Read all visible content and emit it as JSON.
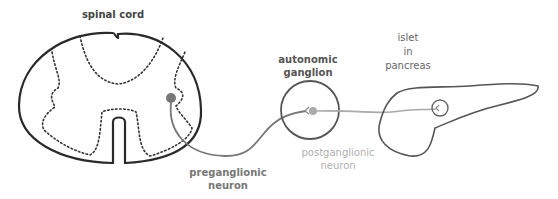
{
  "diagram": {
    "labels": {
      "spinal_cord": "spinal cord",
      "ganglion_line1": "autonomic",
      "ganglion_line2": "ganglion",
      "islet_line1": "islet",
      "islet_line2": "in",
      "islet_line3": "pancreas",
      "pre_line1": "preganglionic",
      "pre_line2": "neuron",
      "post_line1": "postganglionic",
      "post_line2": "neuron"
    },
    "colors": {
      "outline": "#2a2a2a",
      "label_dark": "#444444",
      "pre_neuron": "#777777",
      "post_neuron": "#aaaaaa",
      "islet_label": "#666666"
    }
  }
}
